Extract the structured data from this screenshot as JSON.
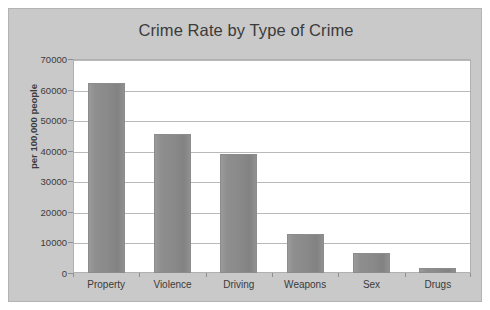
{
  "chart_data": {
    "type": "bar",
    "title": "Crime Rate by Type of Crime",
    "xlabel": "",
    "ylabel": "per 100,000 people",
    "categories": [
      "Property",
      "Violence",
      "Driving",
      "Weapons",
      "Sex",
      "Drugs"
    ],
    "values": [
      62000,
      45500,
      38800,
      12800,
      6500,
      1800
    ],
    "ylim": [
      0,
      70000
    ],
    "yticks": [
      0,
      10000,
      20000,
      30000,
      40000,
      50000,
      60000,
      70000
    ],
    "ytick_labels": [
      "0",
      "10000",
      "20000",
      "30000",
      "40000",
      "50000",
      "60000",
      "70000"
    ],
    "grid": true,
    "legend": false,
    "bar_color": "#8a8a8a",
    "plot_background": "#ffffff",
    "figure_background": "#c9c9c9"
  }
}
